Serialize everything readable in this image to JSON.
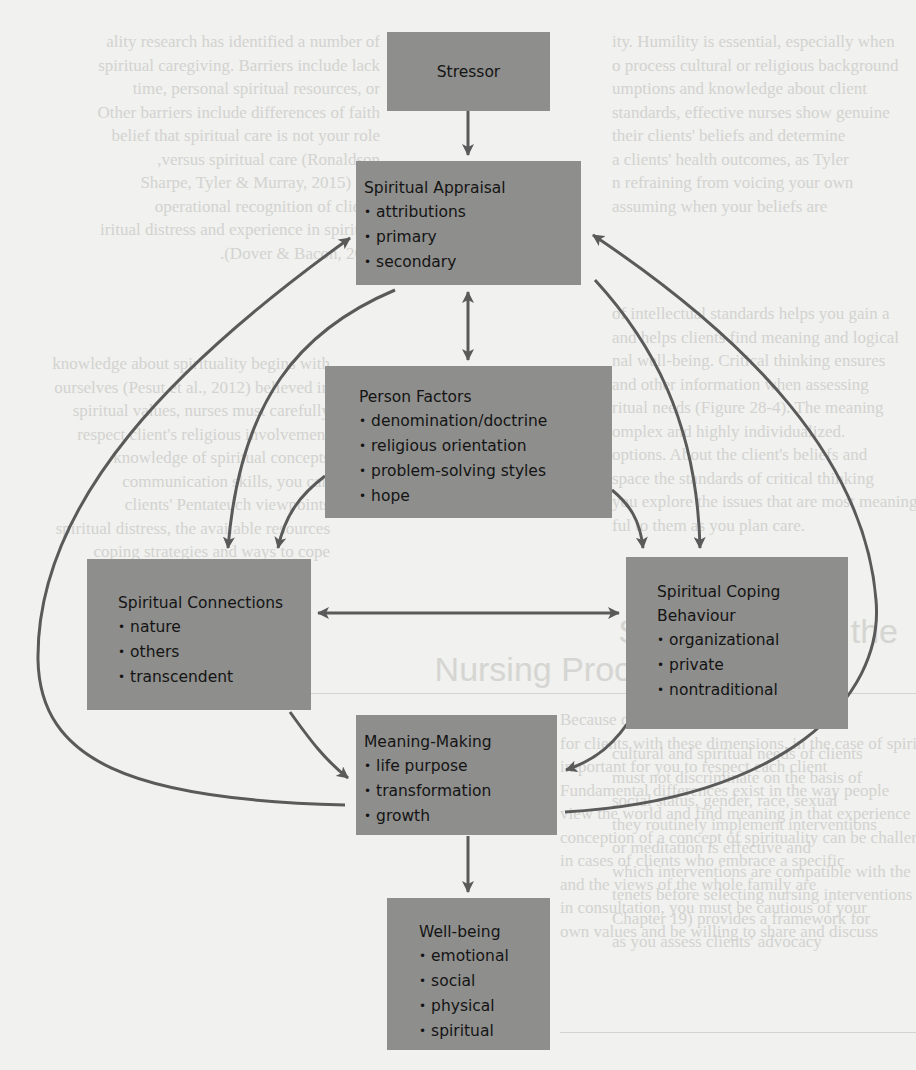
{
  "figure": {
    "colors": {
      "box_fill": "#8e8e8c",
      "arrow": "#5a5a5a",
      "text": "#141414",
      "page_bg": "#f1f1ef"
    },
    "boxes": {
      "stressor": {
        "title": "Stressor",
        "items": []
      },
      "spiritual_appraisal": {
        "title": "Spiritual Appraisal",
        "items": [
          "attributions",
          "primary",
          "secondary"
        ]
      },
      "person_factors": {
        "title": "Person Factors",
        "items": [
          "denomination/doctrine",
          "religious orientation",
          "problem-solving styles",
          "hope"
        ]
      },
      "spiritual_connections": {
        "title": "Spiritual Connections",
        "items": [
          "nature",
          "others",
          "transcendent"
        ]
      },
      "spiritual_coping": {
        "title_line1": "Spiritual Coping",
        "title_line2": "Behaviour",
        "items": [
          "organizational",
          "private",
          "nontraditional"
        ]
      },
      "meaning_making": {
        "title": "Meaning-Making",
        "items": [
          "life purpose",
          "transformation",
          "growth"
        ]
      },
      "well_being": {
        "title": "Well-being",
        "items": [
          "emotional",
          "social",
          "physical",
          "spiritual"
        ]
      }
    },
    "connections": [
      {
        "from": "Stressor",
        "to": "Spiritual Appraisal",
        "type": "one-way"
      },
      {
        "from": "Spiritual Appraisal",
        "to": "Person Factors",
        "type": "two-way"
      },
      {
        "from": "Spiritual Appraisal",
        "to": "Spiritual Connections",
        "type": "one-way"
      },
      {
        "from": "Spiritual Appraisal",
        "to": "Spiritual Coping Behaviour",
        "type": "one-way"
      },
      {
        "from": "Person Factors",
        "to": "Spiritual Connections",
        "type": "one-way"
      },
      {
        "from": "Person Factors",
        "to": "Spiritual Coping Behaviour",
        "type": "one-way"
      },
      {
        "from": "Spiritual Connections",
        "to": "Spiritual Coping Behaviour",
        "type": "two-way"
      },
      {
        "from": "Spiritual Connections",
        "to": "Meaning-Making",
        "type": "one-way"
      },
      {
        "from": "Spiritual Coping Behaviour",
        "to": "Meaning-Making",
        "type": "one-way"
      },
      {
        "from": "Meaning-Making",
        "to": "Spiritual Appraisal",
        "type": "one-way feedback (left loop)"
      },
      {
        "from": "Meaning-Making",
        "to": "Spiritual Appraisal",
        "type": "one-way feedback (right loop)"
      },
      {
        "from": "Meaning-Making",
        "to": "Well-being",
        "type": "one-way"
      }
    ]
  },
  "background_page": {
    "text_right_top": [
      "ity. Humility is essential, especially when",
      "o process cultural or religious background",
      "umptions and knowledge about client",
      "standards, effective nurses show genuine",
      "their clients' beliefs and determine",
      "a clients' health outcomes, as Tyler",
      "n refraining from voicing your own",
      "assuming when your beliefs are"
    ],
    "text_left_top": [
      "ality research has identified a number of",
      "spiritual caregiving. Barriers include lack",
      "time, personal spiritual resources, or",
      "Other barriers include differences of faith",
      "belief that spiritual care is not your role",
      "versus spiritual care (Ronaldson,",
      "Sharpe, Tyler & Murray, 2015) and",
      "operational recognition of clients",
      "iritual distress and experience in spiritual",
      "Dover & Bacon, 2001)."
    ],
    "text_right_mid": [
      "of intellectual standards helps you gain a",
      "and helps clients find meaning and logical",
      "nal well-being. Critical thinking ensures",
      "and other information when assessing",
      "ritual needs (Figure 28-4). The meaning",
      "omplex and highly individualized.",
      "options. About the client's beliefs and",
      "space the standards of critical thinking",
      "you explore the issues that are most meaning-",
      "ful to them as you plan care.",
      "Canadian Nurses",
      "respect for human dignity and",
      "spiritual, cultural, and",
      "biological, psychological,",
      "cultural and spiritual needs of clients"
    ],
    "text_left_mid": [
      "knowledge about spirituality begins with",
      "ourselves (Pesut et al., 2012) believed in",
      "spiritual values, nurses must carefully",
      "respect client's religious involvement",
      "knowledge of spiritual concepts",
      "communication skills, you can",
      "clients' Pentateuch viewpoints",
      "spiritual distress, the available resources",
      "coping strategies and ways to cope"
    ],
    "heading_line1": "Spirituality and the",
    "heading_line2": "Nursing Process",
    "text_left_bottom": [
      "Because of the complexity in caring",
      "for clients with these dimensions, in the case of spirituality",
      "important for you to respect each client",
      "Fundamental differences exist in the way people",
      "view the world and find meaning in that experience",
      "conception of a concept of spirituality can be challenging",
      "in cases of clients who embrace a specific",
      "and the views of the whole family are",
      "in consultation, you must be cautious of your",
      "own values and be willing to share and discuss"
    ],
    "text_right_bottom": [
      "cultural and spiritual needs of clients",
      "must not discriminate on the basis of",
      "social status, gender, race, sexual",
      "they routinely implement interventions",
      "or meditation is effective and",
      "which interventions are compatible with the",
      "tenets before selecting nursing interventions",
      "Chapter 19) provides a framework for",
      "as you assess clients' advocacy"
    ]
  }
}
